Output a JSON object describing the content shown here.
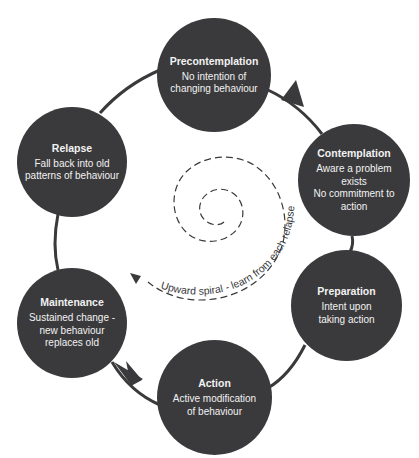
{
  "diagram": {
    "type": "cycle",
    "colors": {
      "node_fill": "#3a3a3c",
      "node_text": "#f2f2f2",
      "line": "#3a3a3c",
      "background": "#ffffff"
    },
    "stages": [
      {
        "title": "Precontemplation",
        "description": "No intention of\nchanging behaviour"
      },
      {
        "title": "Contemplation",
        "description": "Aware a problem\nexists\nNo commitment to\naction"
      },
      {
        "title": "Preparation",
        "description": "Intent upon\ntaking action"
      },
      {
        "title": "Action",
        "description": "Active modification\nof behaviour"
      },
      {
        "title": "Maintenance",
        "description": "Sustained change -\nnew behaviour\nreplaces old"
      },
      {
        "title": "Relapse",
        "description": "Fall back into old\npatterns of behaviour"
      }
    ],
    "spiral_label": "Upward spiral - learn from each relapse"
  }
}
